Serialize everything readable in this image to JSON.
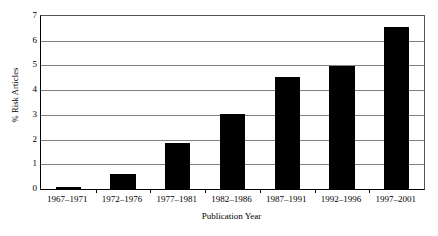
{
  "chart_data": {
    "type": "bar",
    "title": "",
    "subtitle": "",
    "xlabel": "Publication Year",
    "ylabel": "% Risk Articles",
    "categories": [
      "1967–1971",
      "1972–1976",
      "1977–1981",
      "1982–1986",
      "1987–1991",
      "1992–1996",
      "1997–2001"
    ],
    "values": [
      0.1,
      0.6,
      1.85,
      3.05,
      4.55,
      4.97,
      6.55
    ],
    "series": [
      {
        "name": "% Risk Articles",
        "values": [
          0.1,
          0.6,
          1.85,
          3.05,
          4.55,
          4.97,
          6.55
        ]
      }
    ],
    "ylim": [
      0,
      7
    ],
    "yticks": [
      0,
      1,
      2,
      3,
      4,
      5,
      6,
      7
    ],
    "ytick_labels": [
      "0",
      "1",
      "2",
      "3",
      "4",
      "5",
      "6",
      "7"
    ],
    "grid": "horizontal",
    "legend": "none",
    "bar_color": "#000000",
    "grid_color": "#808080",
    "axis_color": "#000000",
    "background_color": "#ffffff",
    "annotations": []
  }
}
